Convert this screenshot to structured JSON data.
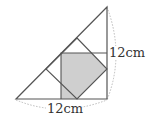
{
  "diagram": {
    "labels": {
      "right_side": "12cm",
      "bottom_side": "12cm"
    },
    "colors": {
      "stroke": "#555555",
      "shade": "#cfcfcf",
      "dashed": "#aaaaaa"
    }
  }
}
